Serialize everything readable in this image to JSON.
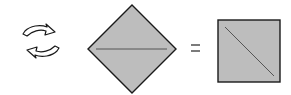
{
  "diagram": {
    "symbols": {
      "turn_over": "turn-over-arrows",
      "equals": "="
    },
    "colors": {
      "paper_fill": "#bdbdbd",
      "outline": "#1a1a1a",
      "crease": "#555555",
      "background": "#ffffff"
    }
  }
}
